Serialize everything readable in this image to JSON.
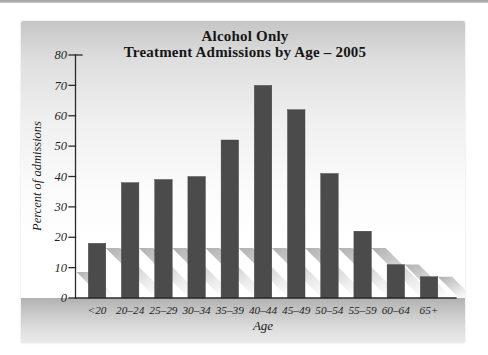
{
  "chart_data": {
    "type": "bar",
    "title_line1": "Alcohol Only",
    "title_line2": "Treatment Admissions by Age – 2005",
    "xlabel": "Age",
    "ylabel": "Percent of admissions",
    "categories": [
      "<20",
      "20–24",
      "25–29",
      "30–34",
      "35–39",
      "40–44",
      "45–49",
      "50–54",
      "55–59",
      "60–64",
      "65+"
    ],
    "values": [
      18,
      38,
      39,
      40,
      52,
      70,
      62,
      41,
      22,
      11,
      7
    ],
    "ylim": [
      0,
      80
    ],
    "ytick_step": 10,
    "grid": false,
    "legend": "none",
    "bar_color": "#4b4b4b",
    "axis_color": "#2a2a2a",
    "tick_label_color": "#1f1f1f",
    "shadow": true
  }
}
